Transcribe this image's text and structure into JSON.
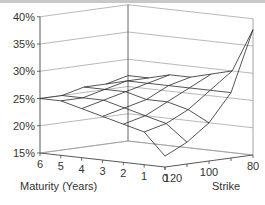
{
  "chart_data": {
    "type": "surface",
    "title": "",
    "xlabel": "Maturity (Years)",
    "ylabel": "Strike",
    "zlabel": "",
    "x": [
      0,
      1,
      2,
      3,
      4,
      5,
      6
    ],
    "y": [
      80,
      90,
      100,
      110,
      120
    ],
    "zlim": [
      15,
      40
    ],
    "z_ticks": [
      "15%",
      "20%",
      "25%",
      "30%",
      "35%",
      "40%"
    ],
    "x_ticks": [
      "6",
      "5",
      "4",
      "3",
      "2",
      "1",
      "0"
    ],
    "y_ticks": [
      "120",
      "100",
      "80"
    ],
    "z_units": "%",
    "values_by_maturity": [
      {
        "maturity": 0,
        "vols": [
          38,
          27,
          22,
          19,
          17
        ]
      },
      {
        "maturity": 1,
        "vols": [
          30,
          27,
          24,
          22,
          21
        ]
      },
      {
        "maturity": 2,
        "vols": [
          29,
          27,
          25,
          23,
          22
        ]
      },
      {
        "maturity": 3,
        "vols": [
          28,
          27,
          25,
          24,
          23
        ]
      },
      {
        "maturity": 4,
        "vols": [
          28,
          27,
          26,
          25,
          24
        ]
      },
      {
        "maturity": 5,
        "vols": [
          27,
          27,
          26,
          25,
          25
        ]
      },
      {
        "maturity": 6,
        "vols": [
          27,
          26,
          26,
          25,
          25
        ]
      }
    ],
    "grid": true
  },
  "axes": {
    "z_labels": [
      "40%",
      "35%",
      "30%",
      "25%",
      "20%",
      "15%"
    ],
    "x_labels": [
      "6",
      "5",
      "4",
      "3",
      "2",
      "1",
      "0"
    ],
    "y_labels": [
      "120",
      "100",
      "80"
    ],
    "x_title": "Maturity (Years)",
    "y_title": "Strike"
  }
}
